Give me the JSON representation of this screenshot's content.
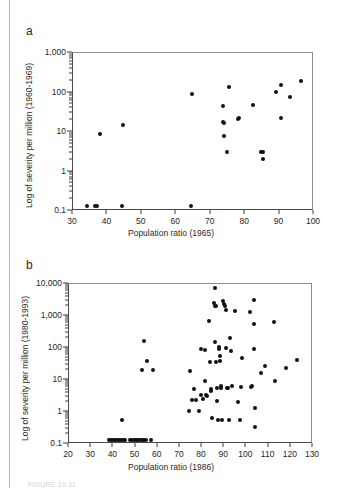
{
  "figure": {
    "panel_a_label": "a",
    "panel_b_label": "b",
    "caption_partial": "FIGURE 10-11"
  },
  "chart_data": [
    {
      "type": "scatter",
      "panel": "a",
      "title": "",
      "xlabel": "Population ratio (1965)",
      "ylabel": "Log of severity per million (1960-1969)",
      "xlim": [
        30,
        100
      ],
      "ylim": [
        0.1,
        1000
      ],
      "yscale": "log",
      "grid": false,
      "legend": null,
      "xticks": [
        30,
        40,
        50,
        60,
        70,
        80,
        90,
        100
      ],
      "ytick_labels": [
        "0.1",
        "1",
        "10",
        "100",
        "1,000"
      ],
      "yticks": [
        0.1,
        1,
        10,
        100,
        1000
      ],
      "points": [
        {
          "x": 34.2,
          "y": 0.13
        },
        {
          "x": 36.3,
          "y": 0.13
        },
        {
          "x": 37.0,
          "y": 0.13
        },
        {
          "x": 44.2,
          "y": 0.13
        },
        {
          "x": 64.3,
          "y": 0.13
        },
        {
          "x": 37.8,
          "y": 8.9
        },
        {
          "x": 44.6,
          "y": 15.0
        },
        {
          "x": 64.7,
          "y": 93.0
        },
        {
          "x": 73.6,
          "y": 45.0
        },
        {
          "x": 73.7,
          "y": 18.0
        },
        {
          "x": 73.9,
          "y": 16.5
        },
        {
          "x": 74.0,
          "y": 7.8
        },
        {
          "x": 74.6,
          "y": 3.2
        },
        {
          "x": 75.4,
          "y": 140.0
        },
        {
          "x": 77.9,
          "y": 21.0
        },
        {
          "x": 78.2,
          "y": 22.0
        },
        {
          "x": 82.2,
          "y": 49.0
        },
        {
          "x": 84.7,
          "y": 3.1
        },
        {
          "x": 85.3,
          "y": 3.2
        },
        {
          "x": 85.2,
          "y": 2.1
        },
        {
          "x": 88.9,
          "y": 105.0
        },
        {
          "x": 90.3,
          "y": 155.0
        },
        {
          "x": 90.4,
          "y": 23.0
        },
        {
          "x": 92.9,
          "y": 75.0
        },
        {
          "x": 96.3,
          "y": 190.0
        }
      ]
    },
    {
      "type": "scatter",
      "panel": "b",
      "title": "",
      "xlabel": "Population ratio (1986)",
      "ylabel": "Log of severity per million (1980-1993)",
      "xlim": [
        20,
        130
      ],
      "ylim": [
        0.1,
        10000
      ],
      "yscale": "log",
      "grid": false,
      "legend": null,
      "xticks": [
        20,
        30,
        40,
        50,
        60,
        70,
        80,
        90,
        100,
        110,
        120,
        130
      ],
      "ytick_labels": [
        "0.1",
        "1",
        "10",
        "100",
        "1,000",
        "10,000"
      ],
      "yticks": [
        0.1,
        1,
        10,
        100,
        1000,
        10000
      ],
      "points": [
        {
          "x": 38.2,
          "y": 0.13
        },
        {
          "x": 39.0,
          "y": 0.13
        },
        {
          "x": 39.8,
          "y": 0.13
        },
        {
          "x": 40.6,
          "y": 0.13
        },
        {
          "x": 41.4,
          "y": 0.13
        },
        {
          "x": 42.2,
          "y": 0.13
        },
        {
          "x": 43.0,
          "y": 0.13
        },
        {
          "x": 43.8,
          "y": 0.13
        },
        {
          "x": 44.6,
          "y": 0.13
        },
        {
          "x": 45.4,
          "y": 0.13
        },
        {
          "x": 47.6,
          "y": 0.13
        },
        {
          "x": 48.4,
          "y": 0.13
        },
        {
          "x": 49.2,
          "y": 0.13
        },
        {
          "x": 50.0,
          "y": 0.13
        },
        {
          "x": 50.8,
          "y": 0.13
        },
        {
          "x": 51.6,
          "y": 0.13
        },
        {
          "x": 52.4,
          "y": 0.13
        },
        {
          "x": 53.2,
          "y": 0.13
        },
        {
          "x": 54.0,
          "y": 0.13
        },
        {
          "x": 54.8,
          "y": 0.13
        },
        {
          "x": 56.8,
          "y": 0.13
        },
        {
          "x": 43.9,
          "y": 0.55
        },
        {
          "x": 53.6,
          "y": 160.0
        },
        {
          "x": 53.0,
          "y": 21.0
        },
        {
          "x": 55.0,
          "y": 38.0
        },
        {
          "x": 57.8,
          "y": 21.0
        },
        {
          "x": 73.9,
          "y": 1.05
        },
        {
          "x": 74.6,
          "y": 19.0
        },
        {
          "x": 75.6,
          "y": 2.3
        },
        {
          "x": 76.5,
          "y": 5.2
        },
        {
          "x": 77.3,
          "y": 2.4
        },
        {
          "x": 78.4,
          "y": 1.05
        },
        {
          "x": 79.4,
          "y": 95.0
        },
        {
          "x": 79.6,
          "y": 3.4
        },
        {
          "x": 80.3,
          "y": 2.6
        },
        {
          "x": 81.2,
          "y": 88.0
        },
        {
          "x": 81.4,
          "y": 9.0
        },
        {
          "x": 81.6,
          "y": 3.3
        },
        {
          "x": 82.4,
          "y": 3.1
        },
        {
          "x": 83.2,
          "y": 700.0
        },
        {
          "x": 83.6,
          "y": 36.0
        },
        {
          "x": 83.9,
          "y": 5.4
        },
        {
          "x": 84.2,
          "y": 4.6
        },
        {
          "x": 84.4,
          "y": 0.63
        },
        {
          "x": 85.6,
          "y": 7300.0
        },
        {
          "x": 85.3,
          "y": 2500.0
        },
        {
          "x": 85.8,
          "y": 2000.0
        },
        {
          "x": 86.2,
          "y": 2100.0
        },
        {
          "x": 86.0,
          "y": 150.0
        },
        {
          "x": 86.4,
          "y": 37.0
        },
        {
          "x": 86.6,
          "y": 5.6
        },
        {
          "x": 86.8,
          "y": 2.2
        },
        {
          "x": 87.0,
          "y": 0.58
        },
        {
          "x": 87.6,
          "y": 110.0
        },
        {
          "x": 87.8,
          "y": 90.0
        },
        {
          "x": 88.0,
          "y": 55.0
        },
        {
          "x": 88.2,
          "y": 40.0
        },
        {
          "x": 88.4,
          "y": 6.5
        },
        {
          "x": 88.6,
          "y": 5.5
        },
        {
          "x": 89.0,
          "y": 0.58
        },
        {
          "x": 89.6,
          "y": 2900.0
        },
        {
          "x": 90.0,
          "y": 2300.0
        },
        {
          "x": 90.2,
          "y": 2100.0
        },
        {
          "x": 90.6,
          "y": 1500.0
        },
        {
          "x": 91.0,
          "y": 100.0
        },
        {
          "x": 91.4,
          "y": 5.8
        },
        {
          "x": 91.8,
          "y": 5.6
        },
        {
          "x": 92.2,
          "y": 0.58
        },
        {
          "x": 92.6,
          "y": 200.0
        },
        {
          "x": 93.0,
          "y": 80.0
        },
        {
          "x": 93.6,
          "y": 6.4
        },
        {
          "x": 94.8,
          "y": 1400.0
        },
        {
          "x": 96.3,
          "y": 2.1
        },
        {
          "x": 97.2,
          "y": 0.58
        },
        {
          "x": 97.6,
          "y": 6.2
        },
        {
          "x": 98.0,
          "y": 49.0
        },
        {
          "x": 101.4,
          "y": 1300.0
        },
        {
          "x": 102.0,
          "y": 6.1
        },
        {
          "x": 102.4,
          "y": 6.3
        },
        {
          "x": 103.2,
          "y": 3100.0
        },
        {
          "x": 103.4,
          "y": 570.0
        },
        {
          "x": 103.6,
          "y": 95.0
        },
        {
          "x": 103.8,
          "y": 1.3
        },
        {
          "x": 104.0,
          "y": 0.35
        },
        {
          "x": 106.6,
          "y": 17.0
        },
        {
          "x": 108.2,
          "y": 28.0
        },
        {
          "x": 112.4,
          "y": 660.0
        },
        {
          "x": 112.8,
          "y": 9.0
        },
        {
          "x": 118.0,
          "y": 24.0
        },
        {
          "x": 122.8,
          "y": 41.0
        }
      ]
    }
  ]
}
